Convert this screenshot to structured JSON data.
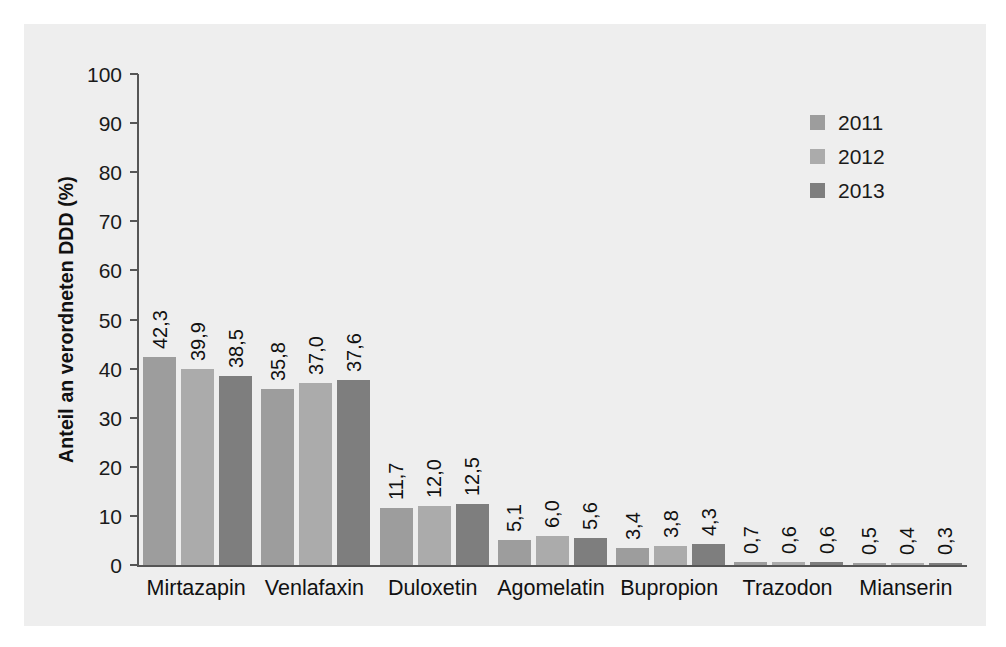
{
  "chart_data": {
    "type": "bar",
    "title": "",
    "xlabel": "",
    "ylabel": "Anteil an verordneten DDD (%)",
    "ylim": [
      0,
      100
    ],
    "yticks": [
      0,
      10,
      20,
      30,
      40,
      50,
      60,
      70,
      80,
      90,
      100
    ],
    "ytick_labels": [
      "0",
      "10",
      "20",
      "30",
      "40",
      "50",
      "60",
      "70",
      "80",
      "90",
      "100"
    ],
    "grid": false,
    "legend_position": "top-right",
    "categories": [
      "Mirtazapin",
      "Venlafaxin",
      "Duloxetin",
      "Agomelatin",
      "Bupropion",
      "Trazodon",
      "Mianserin"
    ],
    "series": [
      {
        "name": "2011",
        "color": "#9d9d9d",
        "values": [
          42.3,
          35.8,
          11.7,
          5.1,
          3.4,
          0.7,
          0.5
        ],
        "labels": [
          "42,3",
          "35,8",
          "11,7",
          "5,1",
          "3,4",
          "0,7",
          "0,5"
        ]
      },
      {
        "name": "2012",
        "color": "#ababab",
        "values": [
          39.9,
          37.0,
          12.0,
          6.0,
          3.8,
          0.6,
          0.4
        ],
        "labels": [
          "39,9",
          "37,0",
          "12,0",
          "6,0",
          "3,8",
          "0,6",
          "0,4"
        ]
      },
      {
        "name": "2013",
        "color": "#7e7e7e",
        "values": [
          38.5,
          37.6,
          12.5,
          5.6,
          4.3,
          0.6,
          0.3
        ],
        "labels": [
          "38,5",
          "37,6",
          "12,5",
          "5,6",
          "4,3",
          "0,6",
          "0,3"
        ]
      }
    ]
  },
  "legend": {
    "items": [
      {
        "label": "2011",
        "color": "#9d9d9d"
      },
      {
        "label": "2012",
        "color": "#ababab"
      },
      {
        "label": "2013",
        "color": "#7e7e7e"
      }
    ]
  },
  "axis": {
    "y_title": "Anteil an verordneten DDD (%)"
  },
  "colors": {
    "panel_background": "#eeeeee",
    "page_background": "#ffffff",
    "axis": "#555555",
    "text": "#111111"
  }
}
